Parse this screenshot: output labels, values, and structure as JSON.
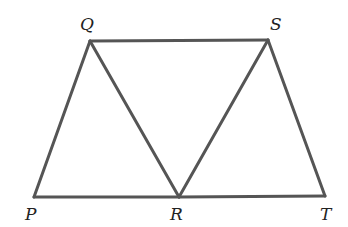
{
  "diagram": {
    "type": "geometry",
    "stroke_color": "#555555",
    "points": {
      "P": {
        "x": 34,
        "y": 197,
        "label": "P",
        "lx": 25,
        "ly": 220
      },
      "Q": {
        "x": 90,
        "y": 41,
        "label": "Q",
        "lx": 80,
        "ly": 30
      },
      "R": {
        "x": 179,
        "y": 197,
        "label": "R",
        "lx": 170,
        "ly": 220
      },
      "S": {
        "x": 268,
        "y": 40,
        "label": "S",
        "lx": 270,
        "ly": 30
      },
      "T": {
        "x": 325,
        "y": 196,
        "label": "T",
        "lx": 320,
        "ly": 220
      }
    },
    "segments": [
      [
        "P",
        "Q"
      ],
      [
        "Q",
        "S"
      ],
      [
        "Q",
        "R"
      ],
      [
        "R",
        "S"
      ],
      [
        "S",
        "T"
      ],
      [
        "P",
        "R"
      ],
      [
        "R",
        "T"
      ]
    ]
  }
}
